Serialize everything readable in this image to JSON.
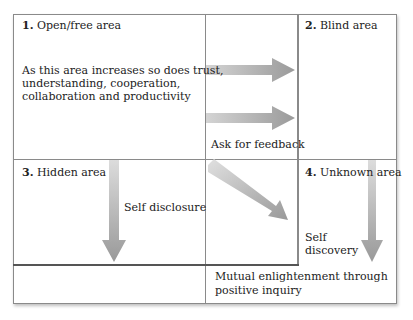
{
  "diagram": {
    "quadrants": [
      {
        "number": "1.",
        "label": "Open/free area",
        "description": "As this area increases so does trust, understanding, cooperation, collaboration and productivity",
        "description_lines": [
          "As this area increases so does trust,",
          "understanding, cooperation,",
          "collaboration and productivity"
        ]
      },
      {
        "number": "2.",
        "label": "Blind area"
      },
      {
        "number": "3.",
        "label": "Hidden area"
      },
      {
        "number": "4.",
        "label": "Unknown area"
      }
    ],
    "arrows": [
      {
        "label": "Ask for feedback",
        "direction": "right"
      },
      {
        "label": "Self disclosure",
        "direction": "down"
      },
      {
        "label": "Self discovery",
        "label_lines": [
          "Self",
          "discovery"
        ],
        "direction": "down"
      },
      {
        "label": "Mutual enlightenment through positive inquiry",
        "label_lines": [
          "Mutual enlightenment through",
          "positive inquiry"
        ],
        "direction": "diagonal"
      }
    ],
    "colors": {
      "border": "#8a8a8a",
      "arrow": "#a0a0a0",
      "text": "#222222"
    }
  }
}
